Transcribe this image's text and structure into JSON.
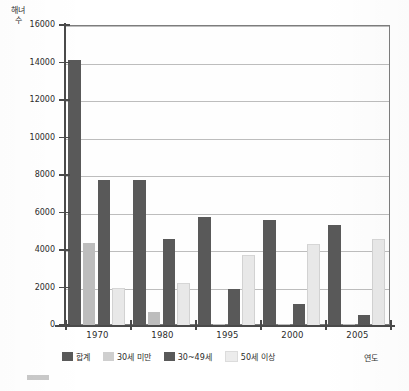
{
  "chart_data": {
    "type": "bar",
    "title": "",
    "xlabel": "연도",
    "ylabel": "해녀 수",
    "categories": [
      "1970",
      "1980",
      "1995",
      "2000",
      "2005"
    ],
    "ylim": [
      0,
      16000
    ],
    "ytick_values": [
      0,
      2000,
      4000,
      6000,
      8000,
      10000,
      12000,
      14000,
      16000
    ],
    "ytick_labels": [
      "0",
      "2000",
      "4000",
      "6000",
      "8000",
      "10000",
      "12000",
      "14000",
      "16000"
    ],
    "grid": true,
    "legend_position": "bottom",
    "series": [
      {
        "name": "합계",
        "color": "#595959",
        "values": [
          14150,
          7750,
          5750,
          5600,
          5350
        ]
      },
      {
        "name": "30세 미만",
        "color": "#bdbdbd",
        "values": [
          4400,
          700,
          60,
          40,
          30
        ]
      },
      {
        "name": "30~49세",
        "color": "#595959",
        "values": [
          7750,
          4600,
          1900,
          1120,
          520
        ]
      },
      {
        "name": "50세 이상",
        "color": "#e8e8e8",
        "values": [
          1950,
          2250,
          3750,
          4300,
          4600
        ]
      }
    ]
  },
  "axes": {
    "y_title": "해녀 수",
    "x_title": "연도"
  },
  "legend": {
    "items": [
      {
        "label": "합계",
        "color": "#595959"
      },
      {
        "label": "30세 미만",
        "color": "#cfcfcf"
      },
      {
        "label": "30~49세",
        "color": "#595959"
      },
      {
        "label": "50세 이상",
        "color": "#ececec"
      }
    ]
  }
}
